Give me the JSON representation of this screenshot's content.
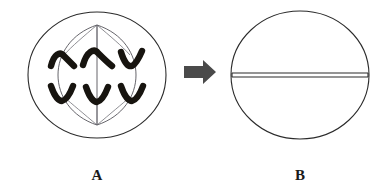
{
  "figure": {
    "background_color": "#ffffff",
    "width": 389,
    "height": 195
  },
  "palette": {
    "outline": "#2b2b2b",
    "chromosome": "#17140f",
    "spindle": "#55545a",
    "fiber": "#6a6a70",
    "arrow": "#4a4a4a",
    "label": "#1a1a1a",
    "cell_fill": "#ffffff"
  },
  "cell_a": {
    "label": "A",
    "center_x": 97,
    "center_y": 75,
    "radius_x": 69,
    "radius_y": 63,
    "poles": {
      "top": {
        "x": 97,
        "y": 25
      },
      "bottom": {
        "x": 97,
        "y": 125
      }
    },
    "chromosome_count": 6,
    "chromosome_shape": "v-shaped",
    "rows": [
      {
        "name": "upper-set",
        "orientation": "apex-up",
        "items": [
          {
            "cx": 62,
            "cy": 58
          },
          {
            "cx": 97,
            "cy": 55
          },
          {
            "cx": 132,
            "cy": 58
          }
        ]
      },
      {
        "name": "lower-set",
        "orientation": "apex-down",
        "items": [
          {
            "cx": 62,
            "cy": 94
          },
          {
            "cx": 97,
            "cy": 97
          },
          {
            "cx": 132,
            "cy": 94
          }
        ]
      }
    ]
  },
  "arrow": {
    "direction": "right",
    "x_start": 184,
    "x_end": 215,
    "y_center": 72
  },
  "cell_b": {
    "label": "B",
    "center_x": 300,
    "center_y": 75,
    "radius_x": 69,
    "radius_y": 64,
    "division": {
      "type": "cell-plate",
      "orientation": "horizontal",
      "y": 75
    }
  },
  "labels": {
    "a": "A",
    "b": "B",
    "a_x": 97,
    "a_y": 180,
    "b_x": 300,
    "b_y": 180
  }
}
